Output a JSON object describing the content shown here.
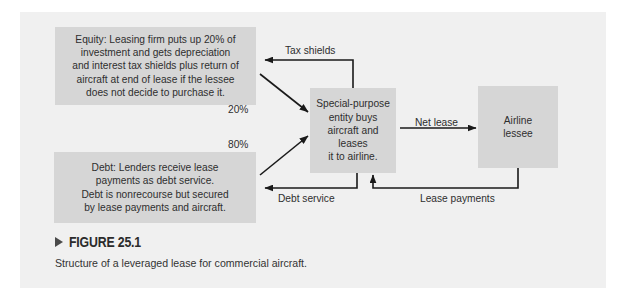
{
  "figure": {
    "marker_icon": "triangle-right-icon",
    "number": "FIGURE 25.1",
    "caption": "Structure of a leveraged lease for commercial aircraft."
  },
  "diagram": {
    "nodes": [
      {
        "id": "equity",
        "text": "Equity: Leasing firm puts up 20% of\ninvestment and gets depreciation\nand interest tax shields plus return of\naircraft at end of lease if the lessee\ndoes not decide to purchase it."
      },
      {
        "id": "debt",
        "text": "Debt: Lenders receive lease\npayments as debt service.\nDebt is nonrecourse but secured\nby lease payments and aircraft."
      },
      {
        "id": "spe",
        "text": "Special-purpose\nentity buys\naircraft and leases\nit to airline."
      },
      {
        "id": "airline",
        "text": "Airline\nlessee"
      }
    ],
    "edges": [
      {
        "id": "tax-shields",
        "label": "Tax shields",
        "from": "spe",
        "to": "equity"
      },
      {
        "id": "equity-share",
        "label": "20%",
        "from": "equity",
        "to": "spe"
      },
      {
        "id": "debt-share",
        "label": "80%",
        "from": "debt",
        "to": "spe"
      },
      {
        "id": "net-lease",
        "label": "Net lease",
        "from": "spe",
        "to": "airline"
      },
      {
        "id": "debt-service",
        "label": "Debt service",
        "from": "spe",
        "to": "debt"
      },
      {
        "id": "lease-payments",
        "label": "Lease payments",
        "from": "airline",
        "to": "spe"
      }
    ]
  },
  "colors": {
    "panel_background": "#f0f0f0",
    "node_fill": "#d6d6d6",
    "text": "#2e2e2e",
    "connector": "#1a1a1a"
  }
}
